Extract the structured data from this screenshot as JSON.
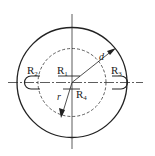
{
  "diagram": {
    "type": "mechanical-drawing",
    "colors": {
      "line": "#222222",
      "background": "#ffffff"
    },
    "center": {
      "x": 72,
      "y": 82.5
    },
    "outer_circle_radius": 55,
    "dashed_circle_radius": 34,
    "labels": {
      "r1": {
        "main": "R",
        "sub": "1"
      },
      "r2": {
        "main": "R",
        "sub": "2"
      },
      "r3": {
        "main": "R",
        "sub": "3"
      },
      "r4": {
        "main": "R",
        "sub": "4"
      },
      "d": "d",
      "r": "r"
    }
  }
}
